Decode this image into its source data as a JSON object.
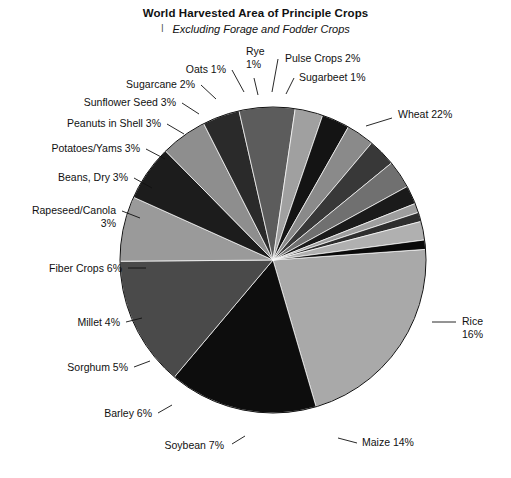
{
  "chart_data": {
    "type": "pie",
    "title": "World Harvested Area of Principle Crops",
    "subtitle": "Excluding Forage and Fodder Crops",
    "subtitle_bullet": "l",
    "units": "percent",
    "legend": "none",
    "labels_on_slices": true,
    "categories": [
      "Wheat",
      "Rice",
      "Maize",
      "Soybean",
      "Barley",
      "Sorghum",
      "Millet",
      "Fiber Crops",
      "Rapeseed/Canola",
      "Beans, Dry",
      "Potatoes/Yams",
      "Peanuts in Shell",
      "Sunflower Seed",
      "Sugarcane",
      "Oats",
      "Rye",
      "Pulse Crops",
      "Sugarbeet"
    ],
    "values": [
      22,
      16,
      14,
      7,
      6,
      5,
      4,
      6,
      3,
      3,
      3,
      3,
      3,
      2,
      1,
      1,
      2,
      1
    ],
    "slices": [
      {
        "label": "Wheat 22%",
        "name": "Wheat",
        "value": 22,
        "color": "#a9a9a9"
      },
      {
        "label": "Rice\n16%",
        "name": "Rice",
        "value": 16,
        "color": "#0d0d0d"
      },
      {
        "label": "Maize 14%",
        "name": "Maize",
        "value": 14,
        "color": "#4a4a4a"
      },
      {
        "label": "Soybean 7%",
        "name": "Soybean",
        "value": 7,
        "color": "#9a9a9a"
      },
      {
        "label": "Barley 6%",
        "name": "Barley",
        "value": 6,
        "color": "#1c1c1c"
      },
      {
        "label": "Sorghum 5%",
        "name": "Sorghum",
        "value": 5,
        "color": "#8e8e8e"
      },
      {
        "label": "Millet 4%",
        "name": "Millet",
        "value": 4,
        "color": "#2a2a2a"
      },
      {
        "label": "Fiber Crops 6%",
        "name": "Fiber Crops",
        "value": 6,
        "color": "#5c5c5c"
      },
      {
        "label": "Rapeseed/Canola\n3%",
        "name": "Rapeseed/Canola",
        "value": 3,
        "color": "#a0a0a0"
      },
      {
        "label": "Beans, Dry 3%",
        "name": "Beans, Dry",
        "value": 3,
        "color": "#141414"
      },
      {
        "label": "Potatoes/Yams 3%",
        "name": "Potatoes/Yams",
        "value": 3,
        "color": "#8a8a8a"
      },
      {
        "label": "Peanuts in Shell 3%",
        "name": "Peanuts in Shell",
        "value": 3,
        "color": "#383838"
      },
      {
        "label": "Sunflower Seed 3%",
        "name": "Sunflower Seed",
        "value": 3,
        "color": "#707070"
      },
      {
        "label": "Sugarcane 2%",
        "name": "Sugarcane",
        "value": 2,
        "color": "#1a1a1a"
      },
      {
        "label": "Oats 1%",
        "name": "Oats",
        "value": 1,
        "color": "#9e9e9e"
      },
      {
        "label": "Rye\n1%",
        "name": "Rye",
        "value": 1,
        "color": "#2e2e2e"
      },
      {
        "label": "Pulse Crops 2%",
        "name": "Pulse Crops",
        "value": 2,
        "color": "#b0b0b0"
      },
      {
        "label": "Sugarbeet 1%",
        "name": "Sugarbeet",
        "value": 1,
        "color": "#0a0a0a"
      }
    ],
    "geometry": {
      "cx": 273,
      "cy": 260,
      "radius": 153,
      "start_angle_deg": -4
    },
    "label_layout": [
      {
        "name": "Wheat",
        "text_x": 398,
        "text_y": 118,
        "anchor": "start",
        "lines": [
          "Wheat 22%"
        ],
        "leader": [
          [
            366,
            126
          ],
          [
            392,
            118
          ]
        ]
      },
      {
        "name": "Rice",
        "text_x": 462,
        "text_y": 325,
        "anchor": "start",
        "lines": [
          "Rice",
          "16%"
        ],
        "leader": [
          [
            432,
            322
          ],
          [
            456,
            322
          ]
        ]
      },
      {
        "name": "Maize",
        "text_x": 362,
        "text_y": 446,
        "anchor": "start",
        "lines": [
          "Maize 14%"
        ],
        "leader": [
          [
            338,
            438
          ],
          [
            357,
            443
          ]
        ]
      },
      {
        "name": "Soybean",
        "text_x": 224,
        "text_y": 449,
        "anchor": "end",
        "lines": [
          "Soybean 7%"
        ],
        "leader": [
          [
            232,
            444
          ],
          [
            245,
            436
          ]
        ]
      },
      {
        "name": "Barley",
        "text_x": 152,
        "text_y": 417,
        "anchor": "end",
        "lines": [
          "Barley 6%"
        ],
        "leader": [
          [
            158,
            413
          ],
          [
            172,
            405
          ]
        ]
      },
      {
        "name": "Sorghum",
        "text_x": 128,
        "text_y": 371,
        "anchor": "end",
        "lines": [
          "Sorghum 5%"
        ],
        "leader": [
          [
            134,
            367
          ],
          [
            150,
            361
          ]
        ]
      },
      {
        "name": "Millet",
        "text_x": 120,
        "text_y": 326,
        "anchor": "end",
        "lines": [
          "Millet 4%"
        ],
        "leader": [
          [
            126,
            322
          ],
          [
            142,
            318
          ]
        ]
      },
      {
        "name": "Fiber Crops",
        "text_x": 122,
        "text_y": 272,
        "anchor": "end",
        "lines": [
          "Fiber Crops 6%"
        ],
        "leader": [
          [
            128,
            268
          ],
          [
            146,
            268
          ]
        ]
      },
      {
        "name": "Rapeseed/Canola",
        "text_x": 116,
        "text_y": 214,
        "anchor": "end",
        "lines": [
          "Rapeseed/Canola",
          "3%"
        ],
        "leader": [
          [
            122,
            211
          ],
          [
            140,
            218
          ]
        ]
      },
      {
        "name": "Beans, Dry",
        "text_x": 128,
        "text_y": 181,
        "anchor": "end",
        "lines": [
          "Beans, Dry 3%"
        ],
        "leader": [
          [
            134,
            178
          ],
          [
            152,
            188
          ]
        ]
      },
      {
        "name": "Potatoes/Yams",
        "text_x": 140,
        "text_y": 152,
        "anchor": "end",
        "lines": [
          "Potatoes/Yams 3%"
        ],
        "leader": [
          [
            146,
            149
          ],
          [
            165,
            159
          ]
        ]
      },
      {
        "name": "Peanuts in Shell",
        "text_x": 161,
        "text_y": 127,
        "anchor": "end",
        "lines": [
          "Peanuts in Shell 3%"
        ],
        "leader": [
          [
            167,
            124
          ],
          [
            184,
            134
          ]
        ]
      },
      {
        "name": "Sunflower Seed",
        "text_x": 176,
        "text_y": 106,
        "anchor": "end",
        "lines": [
          "Sunflower Seed 3%"
        ],
        "leader": [
          [
            182,
            103
          ],
          [
            199,
            114
          ]
        ]
      },
      {
        "name": "Sugarcane",
        "text_x": 195,
        "text_y": 88,
        "anchor": "end",
        "lines": [
          "Sugarcane 2%"
        ],
        "leader": [
          [
            201,
            85
          ],
          [
            216,
            99
          ]
        ]
      },
      {
        "name": "Oats",
        "text_x": 226,
        "text_y": 73,
        "anchor": "end",
        "lines": [
          "Oats 1%"
        ],
        "leader": [
          [
            232,
            70
          ],
          [
            244,
            92
          ]
        ]
      },
      {
        "name": "Rye",
        "text_x": 246,
        "text_y": 55,
        "anchor": "start",
        "lines": [
          "Rye",
          "1%"
        ],
        "leader": [
          [
            254,
            78
          ],
          [
            258,
            95
          ]
        ]
      },
      {
        "name": "Pulse Crops",
        "text_x": 285,
        "text_y": 62,
        "anchor": "start",
        "lines": [
          "Pulse Crops 2%"
        ],
        "leader": [
          [
            278,
            59
          ],
          [
            272,
            92
          ]
        ]
      },
      {
        "name": "Sugarbeet",
        "text_x": 299,
        "text_y": 81,
        "anchor": "start",
        "lines": [
          "Sugarbeet 1%"
        ],
        "leader": [
          [
            294,
            78
          ],
          [
            286,
            94
          ]
        ]
      }
    ]
  }
}
